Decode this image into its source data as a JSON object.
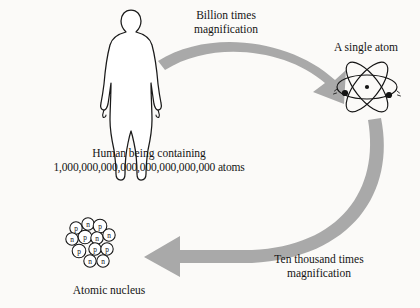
{
  "figure": {
    "title_alt": "Scale of magnification from human to atomic nucleus",
    "background_color": "#fbfaf8",
    "ink_color": "#141414",
    "arrow_color": "#a9a9a9"
  },
  "labels": {
    "billion_magnification_line1": "Billion times",
    "billion_magnification_line2": "magnification",
    "single_atom": "A single atom",
    "human_line1": "Human being containing",
    "human_line2": "1,000,000,000,000,000,000,000,000 atoms",
    "ten_thousand_line1": "Ten thousand times",
    "ten_thousand_line2": "magnification",
    "atomic_nucleus": "Atomic nucleus"
  },
  "nucleus": {
    "particles": [
      {
        "type": "p",
        "cx": 76,
        "cy": 228,
        "r": 6.2
      },
      {
        "type": "n",
        "cx": 88,
        "cy": 224,
        "r": 6.2
      },
      {
        "type": "p",
        "cx": 100,
        "cy": 226,
        "r": 6.8
      },
      {
        "type": "n",
        "cx": 72,
        "cy": 239,
        "r": 6.2
      },
      {
        "type": "p",
        "cx": 85,
        "cy": 237,
        "r": 6.8
      },
      {
        "type": "n",
        "cx": 97,
        "cy": 238,
        "r": 6.2
      },
      {
        "type": "n",
        "cx": 109,
        "cy": 235,
        "r": 6.2
      },
      {
        "type": "p",
        "cx": 79,
        "cy": 251,
        "r": 6.8
      },
      {
        "type": "p",
        "cx": 95,
        "cy": 249,
        "r": 6.2
      },
      {
        "type": "p",
        "cx": 107,
        "cy": 249,
        "r": 6.2
      },
      {
        "type": "n",
        "cx": 90,
        "cy": 261,
        "r": 6.2
      },
      {
        "type": "n",
        "cx": 103,
        "cy": 261,
        "r": 6.2
      }
    ]
  },
  "atom": {
    "orbit_count": 3,
    "electron_count": 2,
    "nucleus_dot": true
  }
}
